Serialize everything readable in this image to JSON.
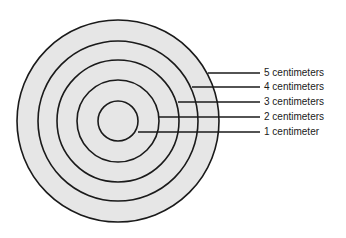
{
  "diagram": {
    "type": "concentric-circles",
    "fill_color": "#e6e6e6",
    "stroke_color": "#1a1a1a",
    "center": [
      118,
      121
    ],
    "rings": [
      {
        "radius_px": 20,
        "label": "1 centimeter"
      },
      {
        "radius_px": 41,
        "label": "2 centimeters"
      },
      {
        "radius_px": 61,
        "label": "3 centimeters"
      },
      {
        "radius_px": 80,
        "label": "4 centimeters"
      },
      {
        "radius_px": 101,
        "label": "5 centimeters"
      }
    ],
    "labels": [
      {
        "text": "5 centimeters",
        "y": 73,
        "line_start_x": 208
      },
      {
        "text": "4 centimeters",
        "y": 87,
        "line_start_x": 192
      },
      {
        "text": "3 centimeters",
        "y": 102,
        "line_start_x": 178
      },
      {
        "text": "2 centimeters",
        "y": 117,
        "line_start_x": 159
      },
      {
        "text": "1 centimeter",
        "y": 132,
        "line_start_x": 138
      }
    ]
  }
}
